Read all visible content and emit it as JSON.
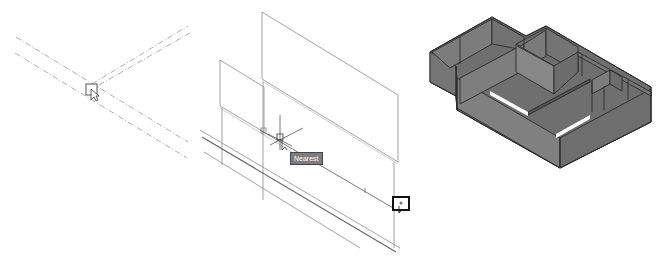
{
  "figure": {
    "panels": [
      {
        "id": "left",
        "description": "Wall junction shown as dashed centerlines with pick-box cursor",
        "cursor": "pickbox-cursor"
      },
      {
        "id": "middle",
        "description": "Wall planes with object snap tracking cursor",
        "snap_tooltip": "Nearest",
        "cursor": "crosshair-cursor"
      },
      {
        "id": "right",
        "description": "Shaded isometric 3D view of building floor plan walls",
        "wall_color": "#7a7a7a",
        "edge_color": "#2a2a2a"
      }
    ]
  }
}
